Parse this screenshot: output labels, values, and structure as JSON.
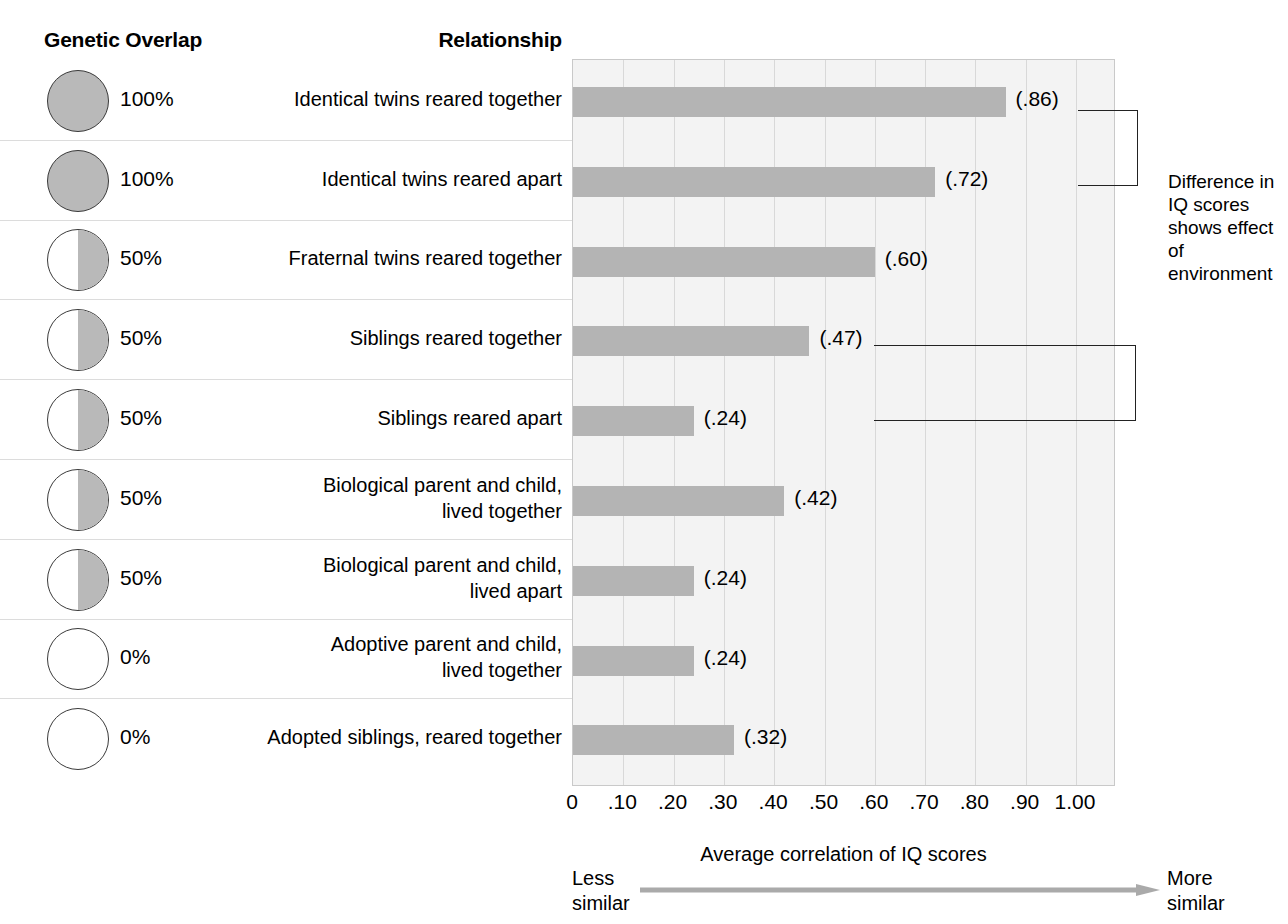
{
  "headers": {
    "genetic_overlap": "Genetic Overlap",
    "relationship": "Relationship"
  },
  "annotation": {
    "text": "Difference in IQ scores shows effect of environment"
  },
  "axis": {
    "title": "Average correlation of IQ scores",
    "less_similar": "Less\nsimilar",
    "less_line1": "Less",
    "less_line2": "similar",
    "more_line1": "More",
    "more_line2": "similar",
    "ticks": [
      "0",
      ".10",
      ".20",
      ".30",
      ".40",
      ".50",
      ".60",
      ".70",
      ".80",
      ".90",
      "1.00"
    ]
  },
  "rows": [
    {
      "overlap_pct": "100%",
      "overlap_value": 100,
      "relationship_line1": "Identical twins reared together",
      "relationship_line2": "",
      "value_label": "(.86)",
      "value": 0.86
    },
    {
      "overlap_pct": "100%",
      "overlap_value": 100,
      "relationship_line1": "Identical twins reared apart",
      "relationship_line2": "",
      "value_label": "(.72)",
      "value": 0.72
    },
    {
      "overlap_pct": "50%",
      "overlap_value": 50,
      "relationship_line1": "Fraternal twins reared together",
      "relationship_line2": "",
      "value_label": "(.60)",
      "value": 0.6
    },
    {
      "overlap_pct": "50%",
      "overlap_value": 50,
      "relationship_line1": "Siblings reared together",
      "relationship_line2": "",
      "value_label": "(.47)",
      "value": 0.47
    },
    {
      "overlap_pct": "50%",
      "overlap_value": 50,
      "relationship_line1": "Siblings reared apart",
      "relationship_line2": "",
      "value_label": "(.24)",
      "value": 0.24
    },
    {
      "overlap_pct": "50%",
      "overlap_value": 50,
      "relationship_line1": "Biological parent and child,",
      "relationship_line2": "lived together",
      "value_label": "(.42)",
      "value": 0.42
    },
    {
      "overlap_pct": "50%",
      "overlap_value": 50,
      "relationship_line1": "Biological parent and child,",
      "relationship_line2": "lived apart",
      "value_label": "(.24)",
      "value": 0.24
    },
    {
      "overlap_pct": "0%",
      "overlap_value": 0,
      "relationship_line1": "Adoptive parent and child,",
      "relationship_line2": "lived together",
      "value_label": "(.24)",
      "value": 0.24
    },
    {
      "overlap_pct": "0%",
      "overlap_value": 0,
      "relationship_line1": "Adopted siblings, reared together",
      "relationship_line2": "",
      "value_label": "(.32)",
      "value": 0.32
    }
  ],
  "colors": {
    "bar": "#b4b4b4",
    "plot_bg": "#f3f3f3",
    "gridline": "#d8d8d8",
    "pie_fill": "#b9b9b9",
    "row_divider": "#dcdcdc",
    "text": "#000000"
  },
  "chart_data": {
    "type": "bar",
    "orientation": "horizontal",
    "title": "",
    "xlabel": "Average correlation of IQ scores",
    "ylabel": "Relationship",
    "xlim": [
      0,
      1.0
    ],
    "xticks": [
      0,
      0.1,
      0.2,
      0.3,
      0.4,
      0.5,
      0.6,
      0.7,
      0.8,
      0.9,
      1.0
    ],
    "xticklabels": [
      "0",
      ".10",
      ".20",
      ".30",
      ".40",
      ".50",
      ".60",
      ".70",
      ".80",
      ".90",
      "1.00"
    ],
    "grid": "vertical",
    "legend": "none",
    "categories": [
      "Identical twins reared together",
      "Identical twins reared apart",
      "Fraternal twins reared together",
      "Siblings reared together",
      "Siblings reared apart",
      "Biological parent and child, lived together",
      "Biological parent and child, lived apart",
      "Adoptive parent and child, lived together",
      "Adopted siblings, reared together"
    ],
    "values": [
      0.86,
      0.72,
      0.6,
      0.47,
      0.24,
      0.42,
      0.24,
      0.24,
      0.32
    ],
    "data_labels": [
      "(.86)",
      "(.72)",
      "(.60)",
      "(.47)",
      "(.24)",
      "(.42)",
      "(.24)",
      "(.24)",
      "(.32)"
    ],
    "genetic_overlap_percent": [
      100,
      100,
      50,
      50,
      50,
      50,
      50,
      0,
      0
    ],
    "annotations": [
      {
        "text": "Difference in IQ scores shows effect of environment",
        "links": [
          "Identical twins reared together",
          "Identical twins reared apart"
        ]
      },
      {
        "text": "Difference in IQ scores shows effect of environment",
        "links": [
          "Siblings reared together",
          "Siblings reared apart"
        ]
      }
    ],
    "axis_arrow": {
      "left_label": "Less similar",
      "right_label": "More similar"
    }
  }
}
